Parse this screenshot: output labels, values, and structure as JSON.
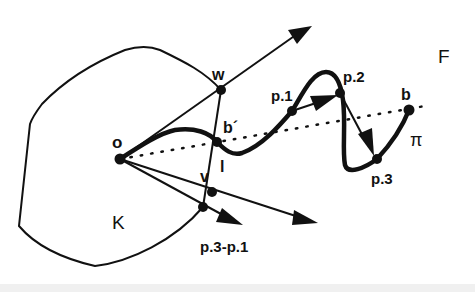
{
  "diagram": {
    "labels": {
      "o": "o",
      "w": "w",
      "b_prime": "b´",
      "l": "l",
      "v": "v",
      "K": "K",
      "F": "F",
      "p1": "p.1",
      "p2": "p.2",
      "p3": "p.3",
      "b": "b",
      "pi": "π",
      "diff": "p.3-p.1"
    },
    "regions": [
      {
        "name": "K",
        "description": "convex region (obstacle)"
      },
      {
        "name": "F",
        "description": "free space"
      }
    ],
    "points": [
      {
        "id": "o",
        "x": 120,
        "y": 159
      },
      {
        "id": "w",
        "x": 221,
        "y": 90
      },
      {
        "id": "l",
        "x": 217,
        "y": 142
      },
      {
        "id": "v",
        "x": 212,
        "y": 192
      },
      {
        "id": "k-edge",
        "x": 203,
        "y": 207
      },
      {
        "id": "p.1",
        "x": 292,
        "y": 111
      },
      {
        "id": "p.2",
        "x": 340,
        "y": 93
      },
      {
        "id": "p.3",
        "x": 377,
        "y": 159
      },
      {
        "id": "b",
        "x": 409,
        "y": 110
      }
    ],
    "edges": [
      {
        "from": "o",
        "to": "arrow-upper",
        "style": "arrow"
      },
      {
        "from": "o",
        "to": "arrow-lower",
        "style": "arrow"
      },
      {
        "from": "k-edge",
        "to": "arrow-diff",
        "style": "arrow",
        "label": "p.3-p.1"
      },
      {
        "from": "p.1",
        "to": "p.2",
        "style": "arrow"
      },
      {
        "from": "p.2",
        "to": "p.3",
        "style": "arrow"
      },
      {
        "from": "o",
        "to": "b",
        "style": "dotted"
      },
      {
        "from": "w",
        "to": "k-edge",
        "style": "segment"
      },
      {
        "from": "o",
        "to": "b",
        "style": "thick-path",
        "label": "π"
      }
    ]
  }
}
